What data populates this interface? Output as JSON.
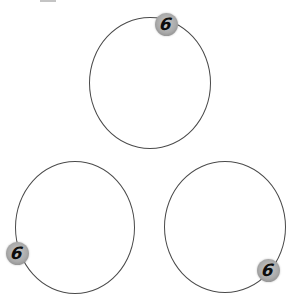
{
  "diagram": {
    "stroke_color": "#4a4a4a",
    "badge_color": "#aaaaaa",
    "digit_color": "#0d0d0d",
    "circles": [
      {
        "id": "top",
        "cx": 150,
        "cy": 83,
        "rx": 61,
        "ry": 66,
        "badge": {
          "label": "6",
          "cx": 166,
          "cy": 24,
          "icon": "number-badge-icon"
        }
      },
      {
        "id": "bottom-left",
        "cx": 75,
        "cy": 227,
        "rx": 60,
        "ry": 66,
        "badge": {
          "label": "6",
          "cx": 17,
          "cy": 253,
          "icon": "number-badge-icon"
        }
      },
      {
        "id": "bottom-right",
        "cx": 225,
        "cy": 227,
        "rx": 61,
        "ry": 66,
        "badge": {
          "label": "6",
          "cx": 268,
          "cy": 270,
          "icon": "number-badge-icon"
        }
      }
    ]
  }
}
